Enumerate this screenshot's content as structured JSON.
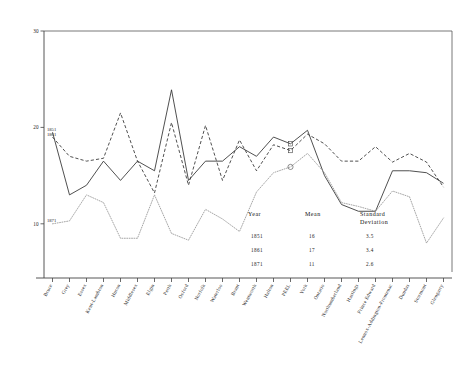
{
  "chart_data": {
    "type": "line",
    "title": "",
    "xlabel": "",
    "ylabel": "",
    "ylim": [
      5,
      30
    ],
    "yticks": [
      10,
      20,
      30
    ],
    "ytick_labels": [
      "10",
      "20",
      "30"
    ],
    "grid": false,
    "legend_position": "inline-left-endpoints",
    "categories": [
      "Bruce",
      "Grey",
      "Essex",
      "Kent-Lambton",
      "Huron",
      "Middlesex",
      "Elgin",
      "Perth",
      "Oxford",
      "Norfolk",
      "Waterloo",
      "Brant",
      "Wentworth",
      "Halton",
      "PEEL",
      "York",
      "Ontario",
      "Northumberland",
      "Hastings",
      "Prince Edward",
      "Lennox-Addington-Frontenac",
      "Dundas",
      "Stormont",
      "Glengarry"
    ],
    "series": [
      {
        "name": "1851",
        "style": "solid",
        "color": "#303030",
        "values": [
          19.5,
          13.0,
          14.0,
          16.5,
          14.5,
          16.5,
          15.5,
          23.9,
          14.5,
          16.5,
          16.5,
          18.0,
          17.0,
          19.0,
          18.3,
          19.7,
          15.0,
          12.0,
          11.3,
          11.3,
          15.5,
          15.5,
          15.3,
          14.2
        ]
      },
      {
        "name": "1861",
        "style": "dashed",
        "color": "#303030",
        "values": [
          19.0,
          17.0,
          16.5,
          16.8,
          21.5,
          16.5,
          13.2,
          20.5,
          14.0,
          20.2,
          14.5,
          18.7,
          15.5,
          18.2,
          17.6,
          19.3,
          18.3,
          16.5,
          16.5,
          18.0,
          16.4,
          17.3,
          16.4,
          13.8
        ]
      },
      {
        "name": "1871",
        "style": "dotted",
        "color": "#8e8e8e",
        "values": [
          10.0,
          10.3,
          13.0,
          12.2,
          8.5,
          8.5,
          13.0,
          9.0,
          8.3,
          11.5,
          10.5,
          9.2,
          13.3,
          15.3,
          15.9,
          17.3,
          15.3,
          12.2,
          11.8,
          11.3,
          13.4,
          12.8,
          8.0,
          10.6
        ]
      }
    ],
    "annotations": {
      "endpoint_labels": [
        "1851",
        "1861",
        "1871"
      ],
      "markers": [
        {
          "shape": "square",
          "series": "1851",
          "category": "PEEL"
        },
        {
          "shape": "square",
          "series": "1861",
          "category": "PEEL"
        },
        {
          "shape": "circle",
          "series": "1871",
          "category": "PEEL"
        }
      ]
    },
    "stats_table": {
      "headers": [
        "Year",
        "Mean",
        "Standard Deviation"
      ],
      "rows": [
        {
          "year": "1851",
          "mean": "16",
          "sd": "3.5"
        },
        {
          "year": "1861",
          "mean": "17",
          "sd": "3.4"
        },
        {
          "year": "1871",
          "mean": "11",
          "sd": "2.6"
        }
      ]
    }
  }
}
